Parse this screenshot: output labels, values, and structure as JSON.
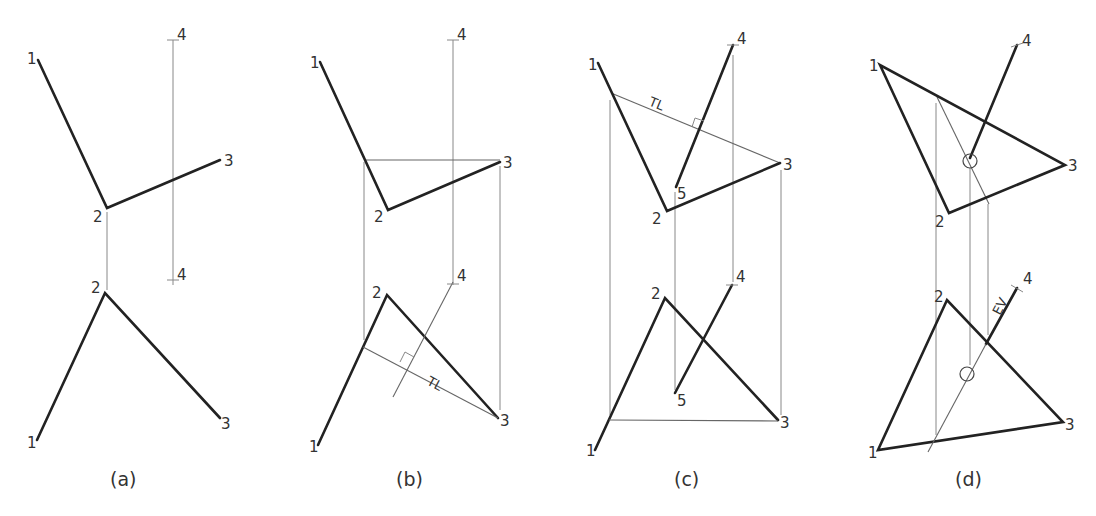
{
  "figure": {
    "panels": [
      {
        "id": "a",
        "caption": "(a)"
      },
      {
        "id": "b",
        "caption": "(b)"
      },
      {
        "id": "c",
        "caption": "(c)"
      },
      {
        "id": "d",
        "caption": "(d)"
      }
    ],
    "labels": {
      "p1": "1",
      "p2": "2",
      "p3": "3",
      "p4": "4",
      "p5": "5",
      "true_length": "TL",
      "edge_view": "EV"
    },
    "colors": {
      "line": "#222222",
      "construction": "#888888",
      "background": "#ffffff"
    }
  }
}
